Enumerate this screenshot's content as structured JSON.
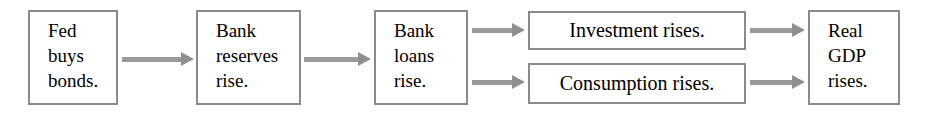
{
  "diagram": {
    "type": "flowchart",
    "background_color": "#ffffff",
    "box_border_color": "#8a8a8a",
    "arrow_color": "#9a9a9a",
    "text_color": "#000000",
    "nodes": [
      {
        "id": "fed-buys-bonds",
        "label": "Fed\nbuys\nbonds.",
        "x": 28,
        "y": 10,
        "w": 90,
        "h": 95,
        "style": "stacked"
      },
      {
        "id": "bank-reserves-rise",
        "label": "Bank\nreserves\nrise.",
        "x": 196,
        "y": 10,
        "w": 105,
        "h": 95,
        "style": "stacked"
      },
      {
        "id": "bank-loans-rise",
        "label": "Bank\nloans\nrise.",
        "x": 374,
        "y": 10,
        "w": 94,
        "h": 95,
        "style": "stacked"
      },
      {
        "id": "investment-rises",
        "label": "Investment rises.",
        "x": 528,
        "y": 11,
        "w": 218,
        "h": 39,
        "style": "wide"
      },
      {
        "id": "consumption-rises",
        "label": "Consumption rises.",
        "x": 528,
        "y": 63,
        "w": 218,
        "h": 41,
        "style": "wide"
      },
      {
        "id": "real-gdp-rises",
        "label": "Real\nGDP\nrises.",
        "x": 808,
        "y": 10,
        "w": 92,
        "h": 95,
        "style": "stacked"
      }
    ],
    "arrows": [
      {
        "id": "arrow-fed-to-reserves",
        "from": "fed-buys-bonds",
        "to": "bank-reserves-rise",
        "x": 122,
        "y": 56,
        "length": 72
      },
      {
        "id": "arrow-reserves-to-loans",
        "from": "bank-reserves-rise",
        "to": "bank-loans-rise",
        "x": 304,
        "y": 56,
        "length": 67
      },
      {
        "id": "arrow-loans-to-investment",
        "from": "bank-loans-rise",
        "to": "investment-rises",
        "x": 472,
        "y": 27,
        "length": 53
      },
      {
        "id": "arrow-loans-to-consumption",
        "from": "bank-loans-rise",
        "to": "consumption-rises",
        "x": 472,
        "y": 79,
        "length": 53
      },
      {
        "id": "arrow-investment-to-gdp",
        "from": "investment-rises",
        "to": "real-gdp-rises",
        "x": 750,
        "y": 27,
        "length": 55
      },
      {
        "id": "arrow-consumption-to-gdp",
        "from": "consumption-rises",
        "to": "real-gdp-rises",
        "x": 750,
        "y": 79,
        "length": 55
      }
    ]
  }
}
